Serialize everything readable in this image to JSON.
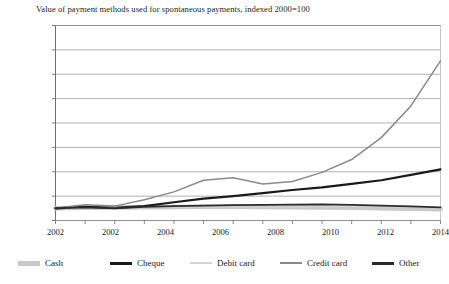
{
  "figure": {
    "clipped_top_text": "value of payment methods used",
    "title": "Value of payment methods used for spontaneous payments, indexed 2000=100"
  },
  "chart_data": {
    "type": "line",
    "title": "Value of payment methods used for spontaneous payments, indexed 2000=100",
    "xlabel": "",
    "ylabel": "",
    "xlim": [
      2001,
      2014
    ],
    "ylim": [
      0,
      1600
    ],
    "ytick_values": [
      0,
      200,
      400,
      600,
      800,
      1000,
      1200,
      1400,
      1600
    ],
    "ytick_labels": [
      "0",
      "200",
      "400",
      "600",
      "800",
      "1,000",
      "1,200",
      "1,400",
      "1,600"
    ],
    "xtick_values": [
      2001,
      2002.857,
      2004.714,
      2006.571,
      2008.429,
      2010.286,
      2012.143,
      2014
    ],
    "xtick_labels": [
      "2002",
      "2002",
      "2004",
      "2006",
      "2008",
      "2010",
      "2012",
      "2014"
    ],
    "x": [
      2001,
      2002,
      2003,
      2004,
      2005,
      2006,
      2007,
      2008,
      2009,
      2010,
      2011,
      2012,
      2013,
      2014
    ],
    "grid": "horizontal",
    "legend_position": "below",
    "series": [
      {
        "name": "Cash",
        "color": "#c9c9c9",
        "width": 4.5,
        "values": [
          100,
          104,
          106,
          108,
          110,
          112,
          112,
          110,
          108,
          106,
          104,
          100,
          96,
          92
        ]
      },
      {
        "name": "Cheque",
        "color": "#1a1a1a",
        "width": 2.2,
        "values": [
          100,
          112,
          104,
          118,
          150,
          180,
          200,
          225,
          250,
          272,
          300,
          330,
          375,
          420
        ]
      },
      {
        "name": "Debit card",
        "color": "#d3d3d3",
        "width": 1.1,
        "values": [
          100,
          102,
          104,
          106,
          108,
          110,
          112,
          112,
          112,
          114,
          116,
          114,
          110,
          106
        ]
      },
      {
        "name": "Credit card",
        "color": "#8a8a8a",
        "width": 1.5,
        "values": [
          100,
          130,
          118,
          170,
          235,
          330,
          350,
          300,
          320,
          395,
          500,
          680,
          940,
          1310
        ]
      },
      {
        "name": "Other",
        "color": "#2b2b2b",
        "width": 1.9,
        "values": [
          100,
          108,
          100,
          112,
          118,
          122,
          126,
          128,
          130,
          132,
          128,
          122,
          116,
          108
        ]
      }
    ]
  },
  "legend": {
    "items": [
      {
        "label": "Cash",
        "color": "#c9c9c9",
        "thickness": 5
      },
      {
        "label": "Cheque",
        "color": "#1a1a1a",
        "thickness": 3
      },
      {
        "label": "Debit card",
        "color": "#d3d3d3",
        "thickness": 1.5
      },
      {
        "label": "Credit card",
        "color": "#8a8a8a",
        "thickness": 2
      },
      {
        "label": "Other",
        "color": "#2b2b2b",
        "thickness": 3
      }
    ],
    "x_positions": [
      18,
      110,
      190,
      280,
      372
    ]
  }
}
